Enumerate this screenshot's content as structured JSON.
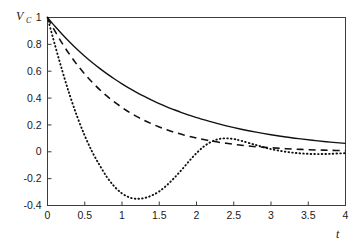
{
  "chart_data": {
    "type": "line",
    "title": "",
    "subtitle": "",
    "xlabel": "t",
    "ylabel": "V",
    "ylabel_subscript": "C",
    "xlim": [
      0,
      4
    ],
    "ylim": [
      -0.4,
      1
    ],
    "grid": false,
    "legend": "none",
    "frame": "box",
    "xticks": [
      0,
      0.5,
      1,
      1.5,
      2,
      2.5,
      3,
      3.5,
      4
    ],
    "xticklabels": [
      "0",
      "0.5",
      "1",
      "1.5",
      "2",
      "2.5",
      "3",
      "3.5",
      "4"
    ],
    "yticks": [
      -0.4,
      -0.2,
      0,
      0.2,
      0.4,
      0.6,
      0.8,
      1
    ],
    "yticklabels": [
      "-0.4",
      "-0.2",
      "0",
      "0.2",
      "0.4",
      "0.6",
      "0.8",
      "1"
    ],
    "series": [
      {
        "name": "overdamped",
        "style": "solid",
        "color": "#111111",
        "x": [
          0,
          0.1,
          0.2,
          0.3,
          0.4,
          0.5,
          0.6,
          0.7,
          0.8,
          0.9,
          1.0,
          1.1,
          1.2,
          1.3,
          1.4,
          1.5,
          1.6,
          1.7,
          1.8,
          1.9,
          2.0,
          2.2,
          2.4,
          2.6,
          2.8,
          3.0,
          3.2,
          3.4,
          3.6,
          3.8,
          4.0
        ],
        "y": [
          1.0,
          0.935,
          0.874,
          0.816,
          0.762,
          0.712,
          0.665,
          0.621,
          0.58,
          0.542,
          0.506,
          0.472,
          0.441,
          0.412,
          0.385,
          0.359,
          0.335,
          0.313,
          0.292,
          0.273,
          0.255,
          0.222,
          0.193,
          0.168,
          0.146,
          0.127,
          0.11,
          0.096,
          0.083,
          0.072,
          0.063
        ]
      },
      {
        "name": "critically-damped",
        "style": "dashed",
        "color": "#111111",
        "x": [
          0,
          0.1,
          0.2,
          0.3,
          0.4,
          0.5,
          0.6,
          0.7,
          0.8,
          0.9,
          1.0,
          1.1,
          1.2,
          1.3,
          1.4,
          1.5,
          1.6,
          1.7,
          1.8,
          1.9,
          2.0,
          2.2,
          2.4,
          2.6,
          2.8,
          3.0,
          3.2,
          3.4,
          3.6,
          3.8,
          4.0
        ],
        "y": [
          1.0,
          0.898,
          0.805,
          0.722,
          0.646,
          0.579,
          0.518,
          0.463,
          0.414,
          0.37,
          0.33,
          0.294,
          0.262,
          0.233,
          0.208,
          0.185,
          0.164,
          0.146,
          0.13,
          0.115,
          0.102,
          0.08,
          0.063,
          0.049,
          0.038,
          0.03,
          0.023,
          0.018,
          0.014,
          0.011,
          0.008
        ]
      },
      {
        "name": "underdamped",
        "style": "dotted",
        "color": "#111111",
        "x": [
          0,
          0.1,
          0.2,
          0.3,
          0.4,
          0.5,
          0.6,
          0.7,
          0.8,
          0.9,
          1.0,
          1.1,
          1.2,
          1.3,
          1.4,
          1.5,
          1.6,
          1.7,
          1.8,
          1.9,
          2.0,
          2.1,
          2.2,
          2.3,
          2.4,
          2.5,
          2.6,
          2.8,
          3.0,
          3.2,
          3.4,
          3.6,
          3.8,
          4.0
        ],
        "y": [
          1.0,
          0.795,
          0.6,
          0.42,
          0.26,
          0.12,
          0.0,
          -0.1,
          -0.19,
          -0.26,
          -0.31,
          -0.34,
          -0.35,
          -0.345,
          -0.325,
          -0.295,
          -0.25,
          -0.195,
          -0.135,
          -0.07,
          -0.01,
          0.04,
          0.075,
          0.095,
          0.1,
          0.095,
          0.082,
          0.05,
          0.02,
          0.0,
          -0.012,
          -0.017,
          -0.015,
          -0.01
        ]
      }
    ]
  }
}
